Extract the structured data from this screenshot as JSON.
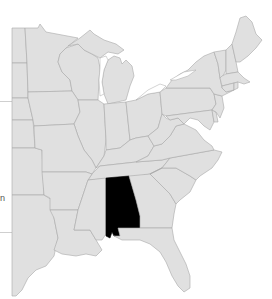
{
  "map": {
    "title": "Eastern United States",
    "highlighted_state": "Alabama",
    "colors": {
      "land": "#e0e0e0",
      "border": "#a8a8a8",
      "highlight": "#000000",
      "water": "#ffffff"
    },
    "states": [
      {
        "id": "MN",
        "name": "Minnesota"
      },
      {
        "id": "WI",
        "name": "Wisconsin"
      },
      {
        "id": "MI",
        "name": "Michigan"
      },
      {
        "id": "IA",
        "name": "Iowa"
      },
      {
        "id": "IL",
        "name": "Illinois"
      },
      {
        "id": "IN",
        "name": "Indiana"
      },
      {
        "id": "OH",
        "name": "Ohio"
      },
      {
        "id": "MO",
        "name": "Missouri"
      },
      {
        "id": "KY",
        "name": "Kentucky"
      },
      {
        "id": "TN",
        "name": "Tennessee"
      },
      {
        "id": "AR",
        "name": "Arkansas"
      },
      {
        "id": "LA",
        "name": "Louisiana"
      },
      {
        "id": "MS",
        "name": "Mississippi"
      },
      {
        "id": "AL",
        "name": "Alabama"
      },
      {
        "id": "GA",
        "name": "Georgia"
      },
      {
        "id": "FL",
        "name": "Florida"
      },
      {
        "id": "SC",
        "name": "South Carolina"
      },
      {
        "id": "NC",
        "name": "North Carolina"
      },
      {
        "id": "VA",
        "name": "Virginia"
      },
      {
        "id": "WV",
        "name": "West Virginia"
      },
      {
        "id": "PA",
        "name": "Pennsylvania"
      },
      {
        "id": "NY",
        "name": "New York"
      },
      {
        "id": "NJ",
        "name": "New Jersey"
      },
      {
        "id": "MD",
        "name": "Maryland"
      },
      {
        "id": "DE",
        "name": "Delaware"
      },
      {
        "id": "CT",
        "name": "Connecticut"
      },
      {
        "id": "RI",
        "name": "Rhode Island"
      },
      {
        "id": "MA",
        "name": "Massachusetts"
      },
      {
        "id": "VT",
        "name": "Vermont"
      },
      {
        "id": "NH",
        "name": "New Hampshire"
      },
      {
        "id": "ME",
        "name": "Maine"
      },
      {
        "id": "TX",
        "name": "Texas (partial)"
      },
      {
        "id": "OK",
        "name": "Oklahoma (partial)"
      },
      {
        "id": "KS",
        "name": "Kansas (partial)"
      },
      {
        "id": "NE",
        "name": "Nebraska (partial)"
      },
      {
        "id": "SD",
        "name": "South Dakota (partial)"
      },
      {
        "id": "ND",
        "name": "North Dakota (partial)"
      }
    ]
  },
  "left_panel": {
    "clipped_text": "n"
  }
}
